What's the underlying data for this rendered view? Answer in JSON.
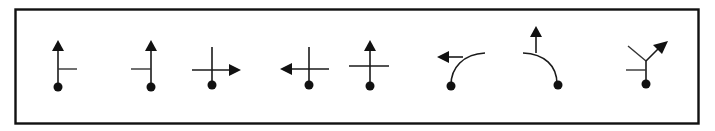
{
  "figure": {
    "colors": {
      "stroke": "#1a1a1a",
      "fill": "#111111",
      "background": "#ffffff",
      "frame": "#111111"
    },
    "symbols": [
      {
        "id": 1,
        "name": "straight-with-right-side-road",
        "direction": "straight"
      },
      {
        "id": 2,
        "name": "straight-with-left-side-road",
        "direction": "straight"
      },
      {
        "id": 3,
        "name": "right-turn-at-crossroads",
        "direction": "right"
      },
      {
        "id": 4,
        "name": "left-turn-at-crossroads",
        "direction": "left"
      },
      {
        "id": 5,
        "name": "straight-through-crossroads",
        "direction": "straight"
      },
      {
        "id": 6,
        "name": "bear-left-on-curve",
        "direction": "left"
      },
      {
        "id": 7,
        "name": "curve-with-straight-exit",
        "direction": "straight"
      },
      {
        "id": 8,
        "name": "bear-right-at-fork",
        "direction": "slight-right"
      }
    ]
  }
}
